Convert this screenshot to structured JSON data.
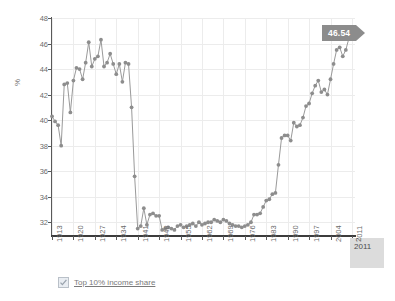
{
  "chart_data": {
    "type": "line",
    "title": "",
    "xlabel": "",
    "ylabel": "%",
    "ylim": [
      31,
      48
    ],
    "xlim": [
      1913,
      2012
    ],
    "grid": true,
    "legend_position": "bottom-left",
    "series": [
      {
        "name": "Top 10% income share",
        "color": "#8d8d8d",
        "x": [
          1913,
          1914,
          1915,
          1916,
          1917,
          1918,
          1919,
          1920,
          1921,
          1922,
          1923,
          1924,
          1925,
          1926,
          1927,
          1928,
          1929,
          1930,
          1931,
          1932,
          1933,
          1934,
          1935,
          1936,
          1937,
          1938,
          1939,
          1940,
          1941,
          1942,
          1943,
          1944,
          1945,
          1946,
          1947,
          1948,
          1949,
          1950,
          1951,
          1952,
          1953,
          1954,
          1955,
          1956,
          1957,
          1958,
          1959,
          1960,
          1961,
          1962,
          1963,
          1964,
          1965,
          1966,
          1967,
          1968,
          1969,
          1970,
          1971,
          1972,
          1973,
          1974,
          1975,
          1976,
          1977,
          1978,
          1979,
          1980,
          1981,
          1982,
          1983,
          1984,
          1985,
          1986,
          1987,
          1988,
          1989,
          1990,
          1991,
          1992,
          1993,
          1994,
          1995,
          1996,
          1997,
          1998,
          1999,
          2000,
          2001,
          2002,
          2003,
          2004,
          2005,
          2006,
          2007,
          2008,
          2009,
          2010,
          2011
        ],
        "y": [
          40.3,
          39.9,
          39.6,
          38.0,
          42.8,
          42.9,
          40.6,
          43.1,
          44.1,
          44.0,
          43.2,
          44.5,
          46.1,
          44.2,
          44.8,
          45.0,
          46.3,
          44.2,
          44.5,
          45.2,
          44.4,
          43.6,
          44.4,
          43.0,
          44.5,
          44.4,
          41.0,
          35.6,
          31.5,
          31.7,
          33.1,
          31.8,
          32.6,
          32.7,
          32.5,
          32.5,
          31.4,
          31.5,
          31.6,
          31.5,
          31.4,
          31.7,
          31.8,
          31.6,
          31.7,
          31.8,
          31.9,
          31.7,
          32.0,
          31.8,
          31.9,
          32.0,
          32.0,
          32.2,
          32.1,
          32.0,
          32.2,
          32.1,
          31.9,
          31.8,
          31.7,
          31.7,
          31.6,
          31.7,
          31.8,
          32.0,
          32.6,
          32.6,
          32.7,
          33.2,
          33.7,
          33.8,
          34.2,
          34.3,
          36.5,
          38.6,
          38.8,
          38.8,
          38.4,
          39.8,
          39.5,
          39.6,
          40.2,
          41.1,
          41.3,
          42.1,
          42.7,
          43.1,
          42.2,
          42.4,
          42.0,
          43.2,
          44.4,
          45.5,
          45.7,
          45.0,
          45.5,
          46.4,
          46.54
        ]
      }
    ],
    "y_ticks": [
      32,
      34,
      36,
      38,
      40,
      42,
      44,
      46,
      48
    ],
    "x_ticks": [
      1913,
      1920,
      1927,
      1934,
      1941,
      1948,
      1955,
      1962,
      1969,
      1976,
      1983,
      1990,
      1997,
      2004,
      2011
    ]
  },
  "tooltip": {
    "value": "46.54"
  },
  "highlight_x": {
    "label": "2011",
    "partial_label": "2"
  },
  "legend": {
    "items": [
      {
        "label": "Top 10% income share",
        "checked": true
      }
    ]
  }
}
